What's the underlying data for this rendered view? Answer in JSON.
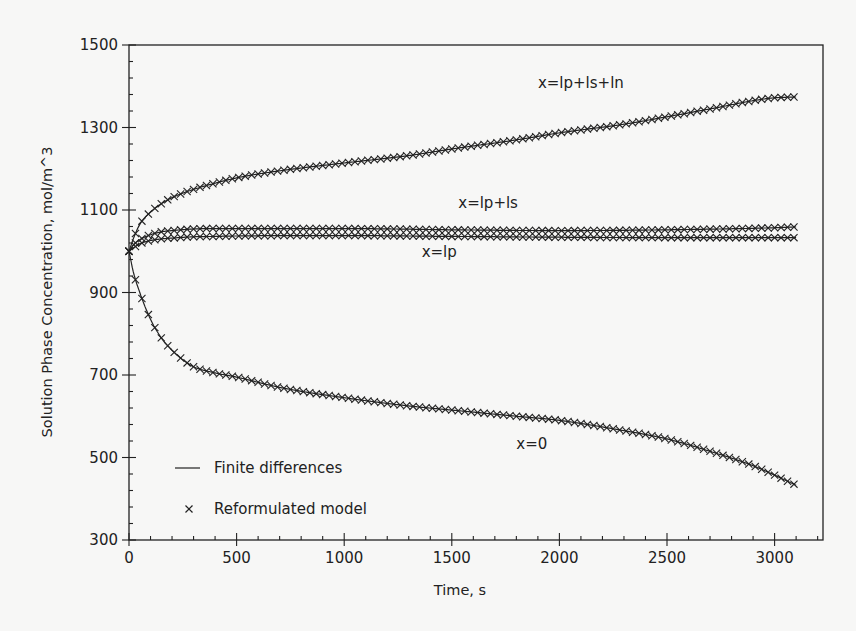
{
  "chart_data": {
    "type": "line",
    "title": "",
    "xlabel": "Time, s",
    "ylabel": "Solution Phase Concentration, mol/m^3",
    "xlim": [
      0,
      3200
    ],
    "ylim": [
      300,
      1500
    ],
    "xticks": [
      0,
      500,
      1000,
      1500,
      2000,
      2500,
      3000
    ],
    "yticks": [
      300,
      500,
      700,
      900,
      1100,
      1300,
      1500
    ],
    "x_minor_step": 100,
    "y_minor_step": 40,
    "grid": false,
    "legend": {
      "position": "lower left",
      "entries": [
        {
          "label": "Finite differences",
          "marker": "line"
        },
        {
          "label": "Reformulated model",
          "marker": "x"
        }
      ]
    },
    "annotations": [
      {
        "text": "x=lp+ls+ln",
        "t": 1900,
        "c": 1395
      },
      {
        "text": "x=lp+ls",
        "t": 1530,
        "c": 1105
      },
      {
        "text": "x=lp",
        "t": 1360,
        "c": 985
      },
      {
        "text": "x=0",
        "t": 1800,
        "c": 520
      }
    ],
    "series": [
      {
        "name": "x=lp+ls+ln",
        "x": [
          0,
          20,
          50,
          100,
          150,
          200,
          300,
          400,
          500,
          700,
          1000,
          1300,
          1500,
          1800,
          2000,
          2300,
          2500,
          2700,
          2900,
          3000,
          3100
        ],
        "y": [
          1000,
          1030,
          1065,
          1095,
          1115,
          1130,
          1150,
          1165,
          1178,
          1195,
          1214,
          1232,
          1248,
          1270,
          1287,
          1308,
          1326,
          1345,
          1365,
          1372,
          1374
        ]
      },
      {
        "name": "x=lp+ls",
        "x": [
          0,
          20,
          50,
          100,
          150,
          200,
          300,
          400,
          500,
          800,
          1000,
          1500,
          2000,
          2500,
          3000,
          3100
        ],
        "y": [
          1000,
          1015,
          1028,
          1040,
          1047,
          1050,
          1054,
          1055,
          1055,
          1055,
          1055,
          1052,
          1050,
          1052,
          1057,
          1059
        ]
      },
      {
        "name": "x=lp",
        "x": [
          0,
          20,
          50,
          100,
          150,
          200,
          300,
          400,
          500,
          800,
          1000,
          1500,
          2000,
          2500,
          3000,
          3100
        ],
        "y": [
          1000,
          1008,
          1018,
          1026,
          1030,
          1032,
          1035,
          1036,
          1037,
          1038,
          1038,
          1036,
          1034,
          1033,
          1033,
          1033
        ]
      },
      {
        "name": "x=0",
        "x": [
          0,
          20,
          50,
          100,
          150,
          200,
          250,
          300,
          400,
          500,
          700,
          1000,
          1300,
          1500,
          1800,
          2000,
          2300,
          2500,
          2700,
          2900,
          3100
        ],
        "y": [
          1000,
          950,
          900,
          835,
          790,
          760,
          737,
          720,
          705,
          695,
          670,
          645,
          625,
          615,
          600,
          590,
          565,
          545,
          515,
          480,
          433
        ]
      }
    ],
    "marker_series": "Reformulated model (x markers on every curve)",
    "marker_step": 30
  }
}
